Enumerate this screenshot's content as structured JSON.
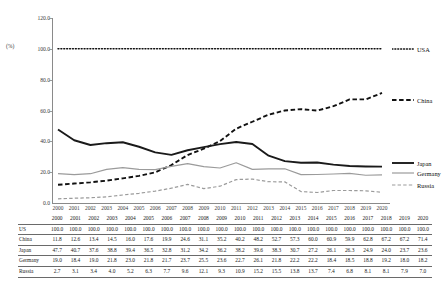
{
  "axis": {
    "unit_label": "(%)",
    "y_ticks": [
      "120.0",
      "100.0",
      "80.0",
      "60.0",
      "40.0",
      "20.0",
      "0.0"
    ]
  },
  "legend": [
    {
      "label": "USA",
      "style": "dotted-thick-dark"
    },
    {
      "label": "China",
      "style": "dashed-thick-dark"
    },
    {
      "label": "Japan",
      "style": "solid-thick-dark"
    },
    {
      "label": "Germany",
      "style": "solid-thin-gray"
    },
    {
      "label": "Russia",
      "style": "dashed-thin-gray"
    }
  ],
  "table": {
    "row_header_blank": "",
    "row_labels": [
      "US",
      "China",
      "Japan",
      "Germany",
      "Russia"
    ]
  },
  "chart_data": {
    "type": "line",
    "title": "",
    "xlabel": "",
    "ylabel": "(%)",
    "ylim": [
      0,
      120
    ],
    "grid": false,
    "legend_position": "right",
    "categories": [
      "2000",
      "2001",
      "2002",
      "2003",
      "2004",
      "2005",
      "2006",
      "2007",
      "2008",
      "2009",
      "2010",
      "2011",
      "2012",
      "2013",
      "2014",
      "2015",
      "2016",
      "2017",
      "2018",
      "2019",
      "2020"
    ],
    "series": [
      {
        "name": "US",
        "values": [
          100.0,
          100.0,
          100.0,
          100.0,
          100.0,
          100.0,
          100.0,
          100.0,
          100.0,
          100.0,
          100.0,
          100.0,
          100.0,
          100.0,
          100.0,
          100.0,
          100.0,
          100.0,
          100.0,
          100.0,
          100.0
        ]
      },
      {
        "name": "China",
        "values": [
          11.8,
          12.6,
          13.4,
          14.5,
          16.0,
          17.6,
          19.9,
          24.6,
          31.1,
          35.2,
          40.2,
          48.2,
          52.7,
          57.3,
          60.0,
          60.9,
          59.9,
          62.8,
          67.2,
          67.2,
          71.4
        ]
      },
      {
        "name": "Japan",
        "values": [
          47.7,
          40.7,
          37.6,
          38.8,
          39.4,
          36.5,
          32.8,
          31.2,
          34.2,
          36.2,
          38.2,
          39.6,
          38.3,
          30.7,
          27.2,
          26.1,
          26.3,
          24.9,
          24.0,
          23.7,
          23.6
        ]
      },
      {
        "name": "Germany",
        "values": [
          19.0,
          18.4,
          19.0,
          21.8,
          23.0,
          21.8,
          21.7,
          23.7,
          25.5,
          23.6,
          22.7,
          26.1,
          21.8,
          22.2,
          22.2,
          18.4,
          18.5,
          18.8,
          19.2,
          18.0,
          18.2
        ]
      },
      {
        "name": "Russia",
        "values": [
          2.7,
          3.1,
          3.4,
          4.0,
          5.2,
          6.3,
          7.7,
          9.6,
          12.1,
          9.3,
          10.9,
          15.2,
          15.5,
          13.8,
          13.7,
          7.4,
          6.8,
          8.1,
          8.1,
          7.9,
          7.0
        ]
      }
    ]
  }
}
